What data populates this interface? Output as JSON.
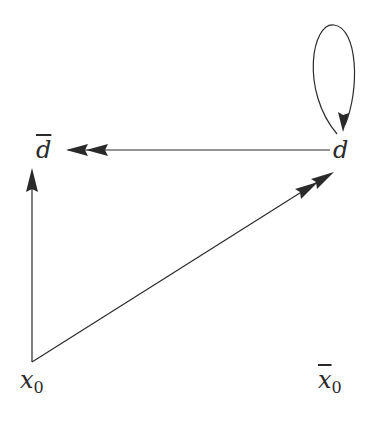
{
  "diagram": {
    "type": "directed-graph",
    "stroke_color": "#2a2a2a",
    "nodes": [
      {
        "id": "dbar",
        "base": "d",
        "bar": true,
        "subscript": "",
        "label": "d̄",
        "x": 36,
        "y": 140
      },
      {
        "id": "d",
        "base": "d",
        "bar": false,
        "subscript": "",
        "label": "d",
        "x": 333,
        "y": 140
      },
      {
        "id": "x0",
        "base": "x",
        "bar": false,
        "subscript": "0",
        "label": "x₀",
        "x": 20,
        "y": 370
      },
      {
        "id": "x0bar",
        "base": "x",
        "bar": true,
        "subscript": "0",
        "label": "x̄₀",
        "x": 318,
        "y": 370
      }
    ],
    "edges": [
      {
        "id": "d-to-dbar",
        "from": "d",
        "to": "dbar",
        "heads": 2
      },
      {
        "id": "x0-to-dbar",
        "from": "x0",
        "to": "dbar",
        "heads": 1
      },
      {
        "id": "x0-to-d",
        "from": "x0",
        "to": "d",
        "heads": 2
      },
      {
        "id": "d-self-loop",
        "from": "d",
        "to": "d",
        "heads": 1
      }
    ]
  }
}
